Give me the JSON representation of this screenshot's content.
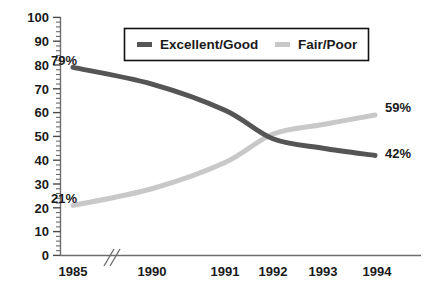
{
  "chart_data": {
    "type": "line",
    "title": "",
    "subtitle": "",
    "xlabel": "",
    "ylabel": "",
    "categories": [
      "1985",
      "1990",
      "1991",
      "1992",
      "1993",
      "1994"
    ],
    "x_axis_break_after": "1985",
    "ylim": [
      0,
      100
    ],
    "y_major_step": 10,
    "y_minor_step": 2,
    "grid": false,
    "legend_position": "top-center-inside",
    "y_tick_labels": [
      "0",
      "10",
      "20",
      "30",
      "40",
      "50",
      "60",
      "70",
      "80",
      "90",
      "100"
    ],
    "series": [
      {
        "name": "Excellent/Good",
        "color": "#555555",
        "values": [
          79,
          72,
          61,
          49,
          45,
          42
        ],
        "point_labels": {
          "1985": "79%",
          "1994": "42%"
        }
      },
      {
        "name": "Fair/Poor",
        "color": "#c8c8c8",
        "values": [
          21,
          28,
          39,
          51,
          55,
          59
        ],
        "point_labels": {
          "1985": "21%",
          "1994": "59%"
        }
      }
    ],
    "annotations": [
      {
        "text": "79%",
        "series": "Excellent/Good",
        "category": "1985"
      },
      {
        "text": "21%",
        "series": "Fair/Poor",
        "category": "1985"
      },
      {
        "text": "59%",
        "series": "Fair/Poor",
        "category": "1994"
      },
      {
        "text": "42%",
        "series": "Excellent/Good",
        "category": "1994"
      }
    ]
  },
  "legend": {
    "entries": [
      {
        "label": "Excellent/Good",
        "color": "#555555"
      },
      {
        "label": "Fair/Poor",
        "color": "#c8c8c8"
      }
    ]
  },
  "colors": {
    "excellent_good": "#555555",
    "fair_poor": "#c8c8c8",
    "axis": "#6e6e6e",
    "text": "#1a1a1a",
    "background": "#ffffff"
  },
  "axis": {
    "y_labels": [
      "100",
      "90",
      "80",
      "70",
      "60",
      "50",
      "40",
      "30",
      "20",
      "10",
      "0"
    ],
    "x_labels": [
      "1985",
      "1990",
      "1991",
      "1992",
      "1993",
      "1994"
    ]
  },
  "value_labels": {
    "eg_start": "79%",
    "eg_end": "42%",
    "fp_start": "21%",
    "fp_end": "59%"
  }
}
